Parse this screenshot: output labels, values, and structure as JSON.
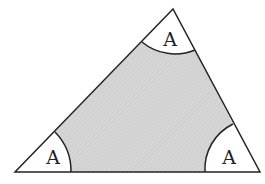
{
  "diagram": {
    "type": "triangle-with-angle-sectors",
    "vertices": {
      "apex": [
        173,
        9
      ],
      "bottom_left": [
        15,
        172
      ],
      "bottom_right": [
        260,
        172
      ]
    },
    "fill_color": "#d9d9d9",
    "stroke_color": "#222222",
    "angle_labels": [
      {
        "position": "top",
        "text": "A"
      },
      {
        "position": "bottom-left",
        "text": "A"
      },
      {
        "position": "bottom-right",
        "text": "A"
      }
    ]
  }
}
